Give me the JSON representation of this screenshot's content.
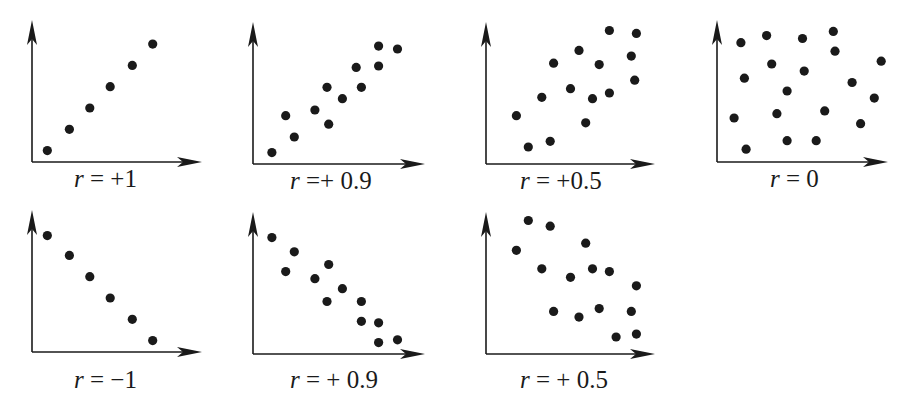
{
  "figure": {
    "dot_color": "#1a1a1a",
    "axis_color": "#1a1a1a",
    "background": "#ffffff"
  },
  "chart_data": [
    {
      "type": "scatter",
      "label_var": "r",
      "label_rest": " = +1",
      "title": "r = +1",
      "xlabel": "",
      "ylabel": "",
      "xlim": [
        0,
        10
      ],
      "ylim": [
        0,
        10
      ],
      "grid": false,
      "points": [
        [
          0.9,
          0.8
        ],
        [
          2.2,
          2.3
        ],
        [
          3.4,
          3.8
        ],
        [
          4.6,
          5.3
        ],
        [
          5.9,
          6.8
        ],
        [
          7.1,
          8.3
        ]
      ]
    },
    {
      "type": "scatter",
      "label_var": "r",
      "label_rest": " =+ 0.9",
      "title": "r =+ 0.9",
      "xlabel": "",
      "ylabel": "",
      "xlim": [
        0,
        10
      ],
      "ylim": [
        0,
        10
      ],
      "grid": false,
      "points": [
        [
          1.1,
          0.8
        ],
        [
          2.4,
          1.9
        ],
        [
          1.9,
          3.4
        ],
        [
          3.6,
          3.8
        ],
        [
          4.4,
          2.8
        ],
        [
          4.3,
          5.4
        ],
        [
          5.2,
          4.6
        ],
        [
          6.3,
          5.4
        ],
        [
          6.0,
          6.8
        ],
        [
          7.3,
          6.9
        ],
        [
          7.3,
          8.3
        ],
        [
          8.4,
          8.1
        ]
      ]
    },
    {
      "type": "scatter",
      "label_var": "r",
      "label_rest": " = +0.5",
      "title": "r = +0.5",
      "xlabel": "",
      "ylabel": "",
      "xlim": [
        0,
        10
      ],
      "ylim": [
        0,
        10
      ],
      "grid": false,
      "points": [
        [
          1.8,
          3.4
        ],
        [
          2.5,
          1.2
        ],
        [
          3.3,
          4.7
        ],
        [
          3.8,
          1.6
        ],
        [
          4.0,
          7.1
        ],
        [
          5.0,
          5.3
        ],
        [
          5.5,
          8.0
        ],
        [
          5.9,
          2.9
        ],
        [
          6.3,
          4.6
        ],
        [
          6.7,
          7.0
        ],
        [
          7.3,
          9.4
        ],
        [
          7.3,
          5.0
        ],
        [
          8.9,
          9.2
        ],
        [
          8.6,
          7.6
        ],
        [
          8.8,
          5.9
        ]
      ]
    },
    {
      "type": "scatter",
      "label_var": "r",
      "label_rest": " = 0",
      "title": "r = 0",
      "xlabel": "",
      "ylabel": "",
      "xlim": [
        0,
        10
      ],
      "ylim": [
        0,
        10
      ],
      "grid": false,
      "points": [
        [
          1.0,
          3.1
        ],
        [
          1.4,
          8.4
        ],
        [
          1.6,
          5.9
        ],
        [
          1.7,
          0.9
        ],
        [
          2.9,
          8.9
        ],
        [
          3.2,
          6.9
        ],
        [
          3.5,
          3.4
        ],
        [
          4.1,
          5.0
        ],
        [
          4.1,
          1.5
        ],
        [
          5.0,
          8.7
        ],
        [
          5.1,
          6.4
        ],
        [
          5.8,
          1.5
        ],
        [
          6.3,
          3.6
        ],
        [
          6.8,
          9.2
        ],
        [
          6.9,
          7.8
        ],
        [
          7.9,
          5.6
        ],
        [
          8.4,
          2.7
        ],
        [
          9.2,
          4.5
        ],
        [
          9.6,
          7.1
        ]
      ]
    },
    {
      "type": "scatter",
      "label_var": "r",
      "label_rest": " = −1",
      "title": "r = −1",
      "xlabel": "",
      "ylabel": "",
      "xlim": [
        0,
        10
      ],
      "ylim": [
        0,
        10
      ],
      "grid": false,
      "points": [
        [
          0.9,
          8.2
        ],
        [
          2.2,
          6.8
        ],
        [
          3.4,
          5.3
        ],
        [
          4.6,
          3.8
        ],
        [
          5.9,
          2.3
        ],
        [
          7.1,
          0.8
        ]
      ]
    },
    {
      "type": "scatter",
      "label_var": "r",
      "label_rest": " = + 0.9",
      "title": "r = + 0.9",
      "xlabel": "",
      "ylabel": "",
      "xlim": [
        0,
        10
      ],
      "ylim": [
        0,
        10
      ],
      "grid": false,
      "points": [
        [
          1.1,
          8.2
        ],
        [
          1.9,
          5.8
        ],
        [
          2.4,
          7.2
        ],
        [
          3.6,
          5.3
        ],
        [
          4.4,
          6.3
        ],
        [
          5.2,
          4.6
        ],
        [
          4.3,
          3.7
        ],
        [
          6.3,
          2.3
        ],
        [
          6.3,
          3.7
        ],
        [
          7.3,
          0.8
        ],
        [
          7.3,
          2.2
        ],
        [
          8.4,
          1.0
        ]
      ]
    },
    {
      "type": "scatter",
      "label_var": "r",
      "label_rest": " = + 0.5",
      "title": "r = + 0.5",
      "xlabel": "",
      "ylabel": "",
      "xlim": [
        0,
        10
      ],
      "ylim": [
        0,
        10
      ],
      "grid": false,
      "points": [
        [
          1.8,
          7.3
        ],
        [
          2.5,
          9.4
        ],
        [
          3.8,
          9.0
        ],
        [
          3.3,
          6.0
        ],
        [
          4.0,
          3.0
        ],
        [
          5.0,
          5.4
        ],
        [
          5.5,
          2.6
        ],
        [
          5.9,
          7.8
        ],
        [
          6.3,
          6.0
        ],
        [
          6.7,
          3.2
        ],
        [
          7.3,
          5.8
        ],
        [
          7.7,
          1.2
        ],
        [
          8.9,
          4.8
        ],
        [
          8.6,
          3.0
        ],
        [
          8.9,
          1.4
        ]
      ]
    }
  ]
}
